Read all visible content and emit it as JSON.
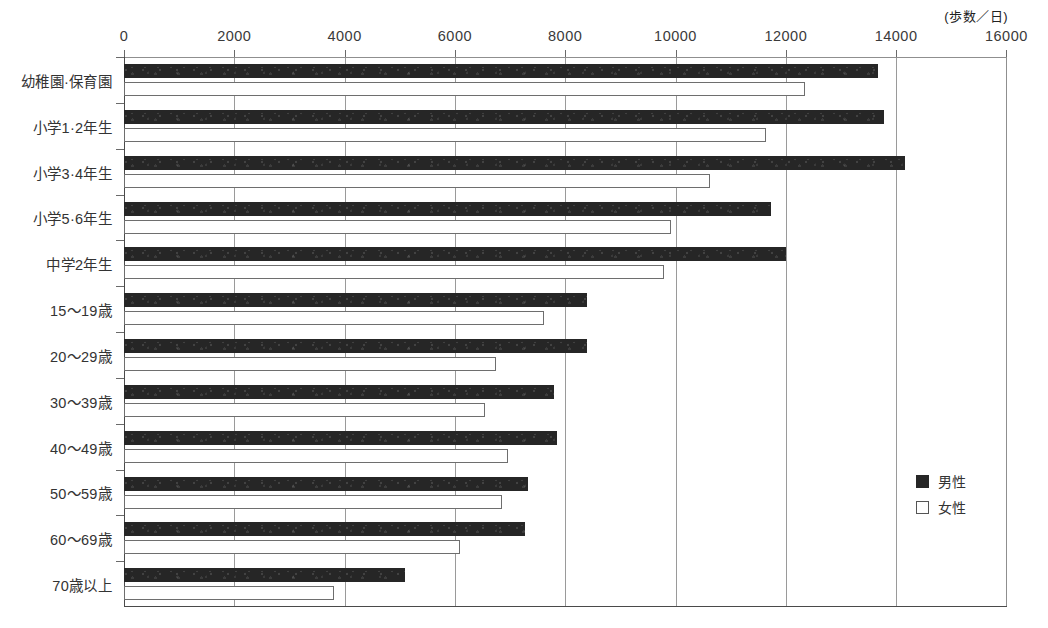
{
  "chart_data": {
    "type": "bar",
    "orientation": "horizontal",
    "title": "",
    "subtitle": "",
    "unit_annotation": "(歩数／日)",
    "xlabel": "",
    "ylabel": "",
    "xlim": [
      0,
      16000
    ],
    "xticks": [
      0,
      2000,
      4000,
      6000,
      8000,
      10000,
      12000,
      14000,
      16000
    ],
    "xtick_labels": [
      "0",
      "2000",
      "4000",
      "6000",
      "8000",
      "10000",
      "12000",
      "14000",
      "16000"
    ],
    "grid": "vertical",
    "legend_position": "right-middle",
    "categories": [
      "幼稚園·保育園",
      "小学1·2年生",
      "小学3·4年生",
      "小学5·6年生",
      "中学2年生",
      "15〜19歳",
      "20〜29歳",
      "30〜39歳",
      "40〜49歳",
      "50〜59歳",
      "60〜69歳",
      "70歳以上"
    ],
    "series": [
      {
        "name": "男性",
        "color": "#262626",
        "style": "filled",
        "values": [
          13670,
          13780,
          14170,
          11740,
          12000,
          8390,
          8390,
          7790,
          7860,
          7330,
          7280,
          5090
        ]
      },
      {
        "name": "女性",
        "color": "#ffffff",
        "style": "outline",
        "values": [
          12340,
          11650,
          10620,
          9910,
          9800,
          7620,
          6750,
          6540,
          6970,
          6850,
          6100,
          3800
        ]
      }
    ]
  },
  "legend": {
    "items": [
      {
        "label": "男性",
        "style": "male"
      },
      {
        "label": "女性",
        "style": "female"
      }
    ]
  }
}
